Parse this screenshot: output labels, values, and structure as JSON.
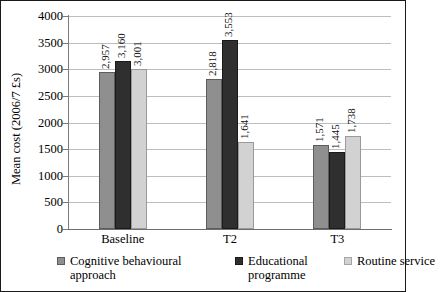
{
  "chart_data": {
    "type": "bar",
    "title": "",
    "subtitle": "",
    "xlabel": "",
    "ylabel": "Mean cost (2006/7 £s)",
    "ylim": [
      0,
      4000
    ],
    "ytick_step": 500,
    "yticks": [
      "0",
      "500",
      "1000",
      "1500",
      "2000",
      "2500",
      "3000",
      "3500",
      "4000"
    ],
    "grid": true,
    "legend_position": "bottom",
    "categories": [
      "Baseline",
      "T2",
      "T3"
    ],
    "series": [
      {
        "name": "Cognitive behavioural approach",
        "color": "#8f8f8f",
        "values": [
          2957,
          3160,
          3001
        ],
        "labels": [
          "2,957",
          "2,818",
          "1,571"
        ]
      },
      {
        "name": "Educational programme",
        "color": "#2f2f2f",
        "values": [
          3160,
          3553,
          1445
        ],
        "labels": [
          "3,160",
          "3,553",
          "1,445"
        ]
      },
      {
        "name": "Routine service",
        "color": "#d2d2d2",
        "values": [
          3001,
          1641,
          1738
        ],
        "labels": [
          "3,001",
          "1,641",
          "1,738"
        ]
      }
    ],
    "data_by_category": [
      {
        "category": "Baseline",
        "values": [
          2957,
          3160,
          3001
        ],
        "labels": [
          "2,957",
          "3,160",
          "3,001"
        ]
      },
      {
        "category": "T2",
        "values": [
          2818,
          3553,
          1641
        ],
        "labels": [
          "2,818",
          "3,553",
          "1,641"
        ]
      },
      {
        "category": "T3",
        "values": [
          1571,
          1445,
          1738
        ],
        "labels": [
          "1,571",
          "1,445",
          "1,738"
        ]
      }
    ]
  },
  "legend": {
    "items": [
      {
        "label": "Cognitive behavioural approach",
        "color": "#8f8f8f"
      },
      {
        "label": "Educational programme",
        "color": "#2f2f2f"
      },
      {
        "label": "Routine service",
        "color": "#d2d2d2"
      }
    ]
  }
}
